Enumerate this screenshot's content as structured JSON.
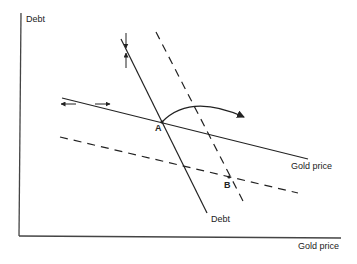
{
  "diagram": {
    "axes": {
      "y_label": "Debt",
      "x_label": "Gold price"
    },
    "lines": {
      "gold_price_initial": {
        "label": "Gold price",
        "style": "solid"
      },
      "gold_price_shifted": {
        "label": "",
        "style": "dashed"
      },
      "debt_initial": {
        "label": "Debt",
        "style": "solid"
      },
      "debt_shifted": {
        "label": "",
        "style": "dashed"
      }
    },
    "points": {
      "A": "A",
      "B": "B"
    },
    "colors": {
      "ink": "#222222",
      "background": "#ffffff"
    }
  }
}
